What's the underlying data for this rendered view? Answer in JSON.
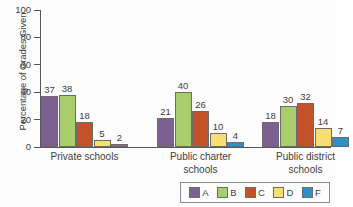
{
  "chart_data": {
    "type": "bar",
    "title": "",
    "xlabel": "",
    "ylabel": "Percentage of Grades Given",
    "ylim": [
      0,
      100
    ],
    "ytick_labels": [
      "100",
      "80",
      "60",
      "40",
      "20",
      "0"
    ],
    "yticks": [
      100,
      80,
      60,
      40,
      20,
      0
    ],
    "grid": false,
    "legend_position": "bottom-right",
    "categories": [
      "Private schools",
      "Public charter schools",
      "Public district schools"
    ],
    "category_lines": [
      [
        "Private schools"
      ],
      [
        "Public charter",
        "schools"
      ],
      [
        "Public district",
        "schools"
      ]
    ],
    "series": [
      {
        "name": "A",
        "color": "#7b6090",
        "values": [
          37,
          21,
          18
        ]
      },
      {
        "name": "B",
        "color": "#a9cc6c",
        "values": [
          38,
          40,
          30
        ]
      },
      {
        "name": "C",
        "color": "#c2522a",
        "values": [
          18,
          26,
          32
        ]
      },
      {
        "name": "D",
        "color": "#f5de72",
        "values": [
          5,
          10,
          14
        ]
      },
      {
        "name": "F",
        "color": "#2e8fc9",
        "values": [
          2,
          4,
          7
        ]
      }
    ]
  },
  "legend": {
    "items": [
      {
        "label": "A",
        "color": "#7b6090"
      },
      {
        "label": "B",
        "color": "#a9cc6c"
      },
      {
        "label": "C",
        "color": "#c2522a"
      },
      {
        "label": "D",
        "color": "#f5de72"
      },
      {
        "label": "F",
        "color": "#2e8fc9"
      }
    ]
  }
}
